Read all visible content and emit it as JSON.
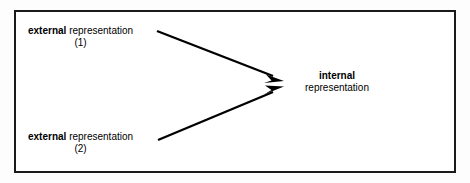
{
  "figure": {
    "type": "diagram",
    "border_color": "#1a1a1a",
    "background_color": "#ffffff",
    "arrow_color": "#000000"
  },
  "nodes": {
    "external_1": {
      "line1_bold": "external",
      "line1_rest": " representation",
      "line2": "(1)"
    },
    "external_2": {
      "line1_bold": "external",
      "line1_rest": " representation",
      "line2": "(2)"
    },
    "internal": {
      "line1_bold": "internal",
      "line2": "representation"
    }
  },
  "arrows": [
    {
      "name": "arrow-external-1-to-internal",
      "from": "external_1",
      "to": "internal",
      "x1": 157,
      "y1": 31,
      "x2": 283,
      "y2": 80
    },
    {
      "name": "arrow-external-2-to-internal",
      "from": "external_2",
      "to": "internal",
      "x1": 158,
      "y1": 140,
      "x2": 283,
      "y2": 87
    }
  ]
}
